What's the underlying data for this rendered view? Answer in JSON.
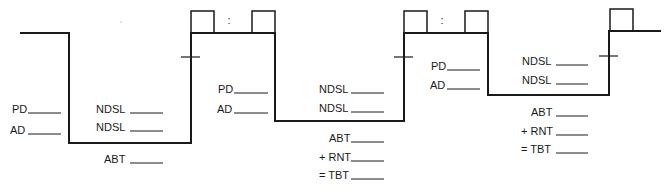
{
  "diagram": {
    "type": "dive-profile",
    "width": 669,
    "height": 191,
    "line_color": "#1a1a1a",
    "profile_path": [
      [
        20,
        33
      ],
      [
        69,
        33
      ],
      [
        69,
        143
      ],
      [
        191,
        143
      ],
      [
        191,
        33
      ],
      [
        275,
        33
      ],
      [
        275,
        121
      ],
      [
        404,
        121
      ],
      [
        404,
        33
      ],
      [
        488,
        33
      ],
      [
        488,
        95
      ],
      [
        609,
        95
      ],
      [
        609,
        31
      ],
      [
        661,
        31
      ]
    ],
    "boxes": [
      {
        "name": "surface-interval-box-1-start",
        "x": 191,
        "y": 11,
        "w": 23,
        "h": 22
      },
      {
        "name": "surface-interval-box-1-end",
        "x": 252,
        "y": 11,
        "w": 23,
        "h": 22
      },
      {
        "name": "surface-interval-box-2-start",
        "x": 404,
        "y": 11,
        "w": 23,
        "h": 22
      },
      {
        "name": "surface-interval-box-2-end",
        "x": 465,
        "y": 11,
        "w": 23,
        "h": 22
      },
      {
        "name": "final-time-box",
        "x": 610,
        "y": 9,
        "w": 23,
        "h": 22
      }
    ],
    "colons": [
      {
        "name": "time-colon-1",
        "x": 229,
        "y": 24,
        "text": ":"
      },
      {
        "name": "time-colon-2",
        "x": 442,
        "y": 24,
        "text": ":"
      }
    ],
    "ticks": [
      {
        "name": "safety-stop-tick-1",
        "x1": 181,
        "x2": 200,
        "y": 57
      },
      {
        "name": "safety-stop-tick-2",
        "x1": 394,
        "x2": 413,
        "y": 57
      },
      {
        "name": "safety-stop-tick-3",
        "x1": 599,
        "x2": 618,
        "y": 56
      }
    ],
    "stray_dot": {
      "x": 121,
      "y": 22
    }
  },
  "dives": [
    {
      "name": "dive-1",
      "left_fields": [
        {
          "name": "planned-depth",
          "label": "PD",
          "lx": 12,
          "ly": 113,
          "line_x1": 28,
          "line_x2": 61
        },
        {
          "name": "actual-depth",
          "label": "AD",
          "lx": 10,
          "ly": 134,
          "line_x1": 28,
          "line_x2": 61
        }
      ],
      "right_fields": [
        {
          "name": "no-deco-limit-1",
          "label": "NDSL",
          "lx": 96,
          "ly": 113,
          "line_x1": 130,
          "line_x2": 163
        },
        {
          "name": "no-deco-limit-2",
          "label": "NDSL",
          "lx": 96,
          "ly": 131,
          "line_x1": 130,
          "line_x2": 163
        },
        {
          "name": "actual-bottom-time",
          "label": "ABT",
          "lx": 104,
          "ly": 163,
          "line_x1": 130,
          "line_x2": 163
        }
      ]
    },
    {
      "name": "dive-2",
      "left_fields": [
        {
          "name": "planned-depth",
          "label": "PD",
          "lx": 218,
          "ly": 93,
          "line_x1": 234,
          "line_x2": 268
        },
        {
          "name": "actual-depth",
          "label": "AD",
          "lx": 217,
          "ly": 113,
          "line_x1": 234,
          "line_x2": 268
        }
      ],
      "right_fields": [
        {
          "name": "no-deco-limit-1",
          "label": "NDSL",
          "lx": 319,
          "ly": 93,
          "line_x1": 351,
          "line_x2": 384
        },
        {
          "name": "no-deco-limit-2",
          "label": "NDSL",
          "lx": 319,
          "ly": 112,
          "line_x1": 351,
          "line_x2": 384
        },
        {
          "name": "actual-bottom-time",
          "label": "ABT",
          "lx": 329,
          "ly": 142,
          "line_x1": 351,
          "line_x2": 384
        },
        {
          "name": "residual-nitrogen-time",
          "label": "+ RNT",
          "lx": 319,
          "ly": 161,
          "line_x1": 351,
          "line_x2": 384
        },
        {
          "name": "total-bottom-time",
          "label": "= TBT",
          "lx": 319,
          "ly": 179,
          "line_x1": 351,
          "line_x2": 384
        }
      ]
    },
    {
      "name": "dive-3",
      "left_fields": [
        {
          "name": "planned-depth",
          "label": "PD",
          "lx": 431,
          "ly": 70,
          "line_x1": 447,
          "line_x2": 480
        },
        {
          "name": "actual-depth",
          "label": "AD",
          "lx": 430,
          "ly": 89,
          "line_x1": 447,
          "line_x2": 480
        }
      ],
      "right_fields": [
        {
          "name": "no-deco-limit-1",
          "label": "NDSL",
          "lx": 522,
          "ly": 65,
          "line_x1": 556,
          "line_x2": 588
        },
        {
          "name": "no-deco-limit-2",
          "label": "NDSL",
          "lx": 522,
          "ly": 84,
          "line_x1": 556,
          "line_x2": 588
        },
        {
          "name": "actual-bottom-time",
          "label": "ABT",
          "lx": 531,
          "ly": 116,
          "line_x1": 556,
          "line_x2": 588
        },
        {
          "name": "residual-nitrogen-time",
          "label": "+ RNT",
          "lx": 521,
          "ly": 135,
          "line_x1": 556,
          "line_x2": 588
        },
        {
          "name": "total-bottom-time",
          "label": "= TBT",
          "lx": 521,
          "ly": 153,
          "line_x1": 556,
          "line_x2": 588
        }
      ]
    }
  ]
}
